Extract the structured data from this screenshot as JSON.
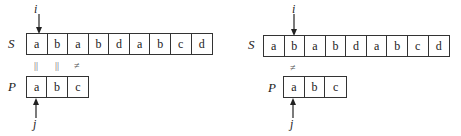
{
  "panels": [
    {
      "string_label": "S",
      "pattern_label": "P",
      "i_label": "i",
      "j_label": "j",
      "string": [
        "a",
        "b",
        "a",
        "b",
        "d",
        "a",
        "b",
        "c",
        "d"
      ],
      "pattern": [
        "a",
        "b",
        "c"
      ],
      "comparisons": [
        "||",
        "||",
        "≠"
      ]
    },
    {
      "string_label": "S",
      "pattern_label": "P",
      "i_label": "i",
      "j_label": "j",
      "string": [
        "a",
        "b",
        "a",
        "b",
        "d",
        "a",
        "b",
        "c",
        "d"
      ],
      "pattern": [
        "a",
        "b",
        "c"
      ],
      "comparisons": [
        "≠"
      ]
    }
  ]
}
